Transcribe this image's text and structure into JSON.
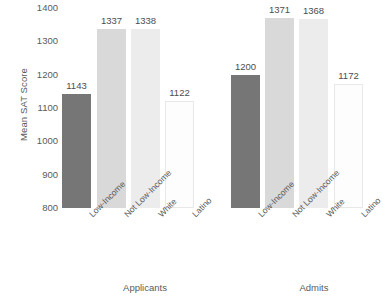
{
  "chart_data": {
    "type": "bar",
    "title": "",
    "xlabel": "",
    "ylabel": "Mean SAT Score",
    "ylim": [
      800,
      1400
    ],
    "ytick_step": 100,
    "yticks": [
      1400,
      1300,
      1200,
      1100,
      1000,
      900,
      800
    ],
    "grid": false,
    "legend": "none",
    "categories": [
      "Low-Income",
      "Not Low-Income",
      "White",
      "Latino"
    ],
    "groups": [
      "Applicants",
      "Admits"
    ],
    "series": [
      {
        "name": "Applicants",
        "values": [
          1143,
          1337,
          1338,
          1122
        ]
      },
      {
        "name": "Admits",
        "values": [
          1200,
          1371,
          1368,
          1172
        ]
      }
    ],
    "bars": [
      {
        "group": "Applicants",
        "category": "Low-Income",
        "value": 1143,
        "label": "1143",
        "color": "#767676"
      },
      {
        "group": "Applicants",
        "category": "Not Low-Income",
        "value": 1337,
        "label": "1337",
        "color": "#d9d9d9"
      },
      {
        "group": "Applicants",
        "category": "White",
        "value": 1338,
        "label": "1338",
        "color": "#ececec"
      },
      {
        "group": "Applicants",
        "category": "Latino",
        "value": 1122,
        "label": "1122",
        "color": "#fdfdfd"
      },
      {
        "group": "Admits",
        "category": "Low-Income",
        "value": 1200,
        "label": "1200",
        "color": "#767676"
      },
      {
        "group": "Admits",
        "category": "Not Low-Income",
        "value": 1371,
        "label": "1371",
        "color": "#d9d9d9"
      },
      {
        "group": "Admits",
        "category": "White",
        "value": 1368,
        "label": "1368",
        "color": "#ececec"
      },
      {
        "group": "Admits",
        "category": "Latino",
        "value": 1172,
        "label": "1172",
        "color": "#fdfdfd"
      }
    ],
    "colors": {
      "low_income": "#767676",
      "not_low_income": "#d9d9d9",
      "white": "#ececec",
      "latino": "#fdfdfd",
      "text": "#5a5a5a",
      "background": "#ffffff"
    }
  }
}
